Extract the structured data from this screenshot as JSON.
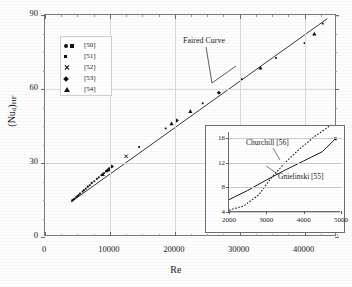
{
  "chart_data": {
    "type": "scatter",
    "title": "",
    "xlabel": "Re",
    "ylabel": "(Nuₓ)ₕᵢₑ",
    "ylabel_plain": "(Nud)HF",
    "xlim": [
      0,
      45000
    ],
    "ylim": [
      0,
      90
    ],
    "xticks": [
      0,
      10000,
      20000,
      30000,
      40000
    ],
    "yticks": [
      0,
      30,
      60,
      90
    ],
    "grid": true,
    "legend_position": "upper-left-inside",
    "annotations": [
      {
        "text": "Faired Curve",
        "x": 22000,
        "y": 79
      }
    ],
    "series": [
      {
        "name": "[50]",
        "marker": "circle-and-square",
        "points": [
          [
            4200,
            14.8
          ],
          [
            4500,
            15.4
          ],
          [
            5000,
            16.6
          ],
          [
            5400,
            17.6
          ],
          [
            6000,
            19.0
          ],
          [
            6600,
            20.4
          ],
          [
            7200,
            21.9
          ],
          [
            8000,
            23.6
          ],
          [
            8700,
            25.1
          ],
          [
            9400,
            26.6
          ],
          [
            9900,
            27.8
          ]
        ]
      },
      {
        "name": "[51]",
        "marker": "square-small",
        "points": [
          [
            4300,
            15.0
          ],
          [
            4800,
            16.1
          ],
          [
            5200,
            17.0
          ],
          [
            5800,
            18.4
          ],
          [
            6300,
            19.6
          ],
          [
            6900,
            21.0
          ],
          [
            7600,
            22.6
          ],
          [
            8300,
            24.2
          ],
          [
            9100,
            25.9
          ],
          [
            14500,
            36.5
          ],
          [
            18600,
            44.0
          ],
          [
            24300,
            54.2
          ],
          [
            30300,
            64.0
          ],
          [
            35600,
            72.6
          ],
          [
            40000,
            78.6
          ],
          [
            42800,
            86.5
          ]
        ]
      },
      {
        "name": "[52]",
        "marker": "cross",
        "points": [
          [
            12500,
            32.7
          ]
        ]
      },
      {
        "name": "[53]",
        "marker": "diamond",
        "points": [
          [
            9600,
            27.0
          ],
          [
            10300,
            28.6
          ],
          [
            20300,
            47.2
          ],
          [
            26800,
            58.5
          ]
        ]
      },
      {
        "name": "[54]",
        "marker": "triangle",
        "points": [
          [
            8900,
            25.4
          ],
          [
            9800,
            27.3
          ],
          [
            19500,
            46.0
          ],
          [
            22400,
            51.0
          ],
          [
            33200,
            68.6
          ],
          [
            41500,
            82.4
          ]
        ]
      }
    ],
    "faired_curve": {
      "name": "Faired Curve",
      "style": "solid",
      "points": [
        [
          4000,
          14.2
        ],
        [
          43500,
          88.5
        ]
      ]
    },
    "inset": {
      "type": "line",
      "xlim": [
        2000,
        5000
      ],
      "ylim": [
        4,
        17
      ],
      "xticks": [
        2000,
        3000,
        4000,
        5000
      ],
      "yticks": [
        4,
        8,
        12,
        16
      ],
      "grid": true,
      "series": [
        {
          "name": "Gnielinski [55]",
          "style": "solid",
          "points": [
            [
              2000,
              6.0
            ],
            [
              2500,
              7.5
            ],
            [
              3000,
              9.2
            ],
            [
              3500,
              10.8
            ],
            [
              4000,
              12.3
            ],
            [
              4500,
              13.8
            ],
            [
              4850,
              15.9
            ]
          ]
        },
        {
          "name": "Churchill [56]",
          "style": "dashed",
          "points": [
            [
              2000,
              4.3
            ],
            [
              2400,
              5.0
            ],
            [
              2800,
              6.8
            ],
            [
              3100,
              9.3
            ],
            [
              3500,
              12.0
            ],
            [
              3900,
              14.3
            ],
            [
              4300,
              16.3
            ],
            [
              4700,
              18.0
            ]
          ]
        }
      ],
      "marker_point": {
        "x": 4850,
        "y": 15.9,
        "marker": "square"
      },
      "annotations": [
        {
          "text": "Churchill [56]",
          "x": 2750,
          "y": 16.0
        },
        {
          "text": "Gnielinski [55]",
          "x": 3850,
          "y": 11.2
        }
      ]
    }
  },
  "legend": {
    "entries": [
      {
        "label": "[50]",
        "markers": [
          "circle",
          "square"
        ]
      },
      {
        "label": "[51]",
        "markers": [
          "square-small"
        ]
      },
      {
        "label": "[52]",
        "markers": [
          "cross"
        ]
      },
      {
        "label": "[53]",
        "markers": [
          "diamond"
        ]
      },
      {
        "label": "[54]",
        "markers": [
          "triangle"
        ]
      }
    ]
  },
  "axes": {
    "x_title": "Re",
    "y_title": "(Nu",
    "y_title_sub": "d",
    "y_title_suffix": ")",
    "y_title_sub2": "HF",
    "x_tick_labels": [
      "0",
      "10000",
      "20000",
      "30000",
      "40000"
    ],
    "y_tick_labels": [
      "0",
      "30",
      "60",
      "90"
    ]
  },
  "inset_axes": {
    "x_tick_labels": [
      "2000",
      "3000",
      "4000",
      "5000"
    ],
    "y_tick_labels": [
      "4",
      "8",
      "12",
      "16"
    ]
  },
  "annotations": {
    "faired_curve": "Faired Curve",
    "churchill": "Churchill [56]",
    "gnielinski": "Gnielinski [55]"
  },
  "colors": {
    "marker": "#111111",
    "curve": "#222222",
    "grid": "#d8d8d8",
    "axis": "#7a7a7a",
    "background": "#fdfdfd"
  }
}
